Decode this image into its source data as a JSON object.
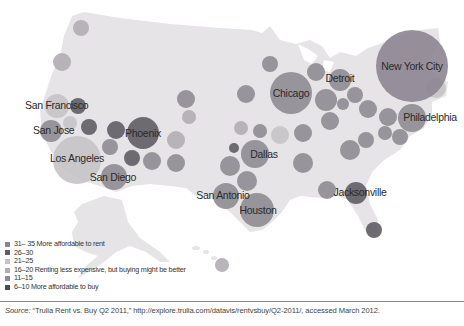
{
  "chart_data": {
    "type": "bubble-map",
    "title": "",
    "legend": [
      {
        "range": "31–35",
        "label": "More affordable to rent",
        "color": "#8d8592"
      },
      {
        "range": "26–30",
        "label": "",
        "color": "#615c64"
      },
      {
        "range": "21–25",
        "label": "",
        "color": "#c6c3c8"
      },
      {
        "range": "16–20",
        "label": "Renting less expensive, but buying might be better",
        "color": "#b1adb3"
      },
      {
        "range": "11–15",
        "label": "",
        "color": "#8f8b92"
      },
      {
        "range": "6–10",
        "label": "More affordable to buy",
        "color": "#4f4b52"
      }
    ],
    "labeled_cities": [
      {
        "name": "New York City",
        "x": 412,
        "y": 66,
        "r": 36,
        "color": "#8d8592"
      },
      {
        "name": "Chicago",
        "x": 291,
        "y": 93,
        "r": 21,
        "color": "#8f8b92"
      },
      {
        "name": "Detroit",
        "x": 340,
        "y": 80,
        "r": 11,
        "color": "#8f8b92"
      },
      {
        "name": "Philadelphia",
        "x": 412,
        "y": 118,
        "r": 14,
        "color": "#8f8b92"
      },
      {
        "name": "San Francisco",
        "x": 57,
        "y": 106,
        "r": 12,
        "color": "#c6c3c8"
      },
      {
        "name": "San Jose",
        "x": 51,
        "y": 131,
        "r": 11,
        "color": "#8f8b92"
      },
      {
        "name": "Los Angeles",
        "x": 77,
        "y": 160,
        "r": 24,
        "color": "#c6c3c8"
      },
      {
        "name": "San Diego",
        "x": 114,
        "y": 177,
        "r": 13,
        "color": "#8f8b92"
      },
      {
        "name": "Phoenix",
        "x": 143,
        "y": 133,
        "r": 16,
        "color": "#615c64"
      },
      {
        "name": "Dallas",
        "x": 255,
        "y": 154,
        "r": 14,
        "color": "#8f8b92"
      },
      {
        "name": "San Antonio",
        "x": 226,
        "y": 196,
        "r": 13,
        "color": "#8f8b92"
      },
      {
        "name": "Houston",
        "x": 257,
        "y": 210,
        "r": 17,
        "color": "#8f8b92"
      },
      {
        "name": "Jacksonville",
        "x": 356,
        "y": 193,
        "r": 11,
        "color": "#615c64"
      }
    ],
    "unlabeled_cities": [
      {
        "x": 81,
        "y": 28,
        "r": 8,
        "color": "#b1adb3"
      },
      {
        "x": 62,
        "y": 62,
        "r": 9,
        "color": "#b1adb3"
      },
      {
        "x": 78,
        "y": 106,
        "r": 8,
        "color": "#615c64"
      },
      {
        "x": 70,
        "y": 123,
        "r": 7,
        "color": "#c6c3c8"
      },
      {
        "x": 89,
        "y": 127,
        "r": 8,
        "color": "#615c64"
      },
      {
        "x": 116,
        "y": 130,
        "r": 9,
        "color": "#615c64"
      },
      {
        "x": 110,
        "y": 147,
        "r": 8,
        "color": "#8f8b92"
      },
      {
        "x": 132,
        "y": 158,
        "r": 8,
        "color": "#615c64"
      },
      {
        "x": 152,
        "y": 161,
        "r": 9,
        "color": "#8f8b92"
      },
      {
        "x": 176,
        "y": 163,
        "r": 9,
        "color": "#8f8b92"
      },
      {
        "x": 186,
        "y": 99,
        "r": 9,
        "color": "#8f8b92"
      },
      {
        "x": 189,
        "y": 117,
        "r": 7,
        "color": "#b1adb3"
      },
      {
        "x": 176,
        "y": 140,
        "r": 9,
        "color": "#b1adb3"
      },
      {
        "x": 246,
        "y": 94,
        "r": 9,
        "color": "#8f8b92"
      },
      {
        "x": 241,
        "y": 128,
        "r": 7,
        "color": "#b1adb3"
      },
      {
        "x": 234,
        "y": 148,
        "r": 5,
        "color": "#615c64"
      },
      {
        "x": 260,
        "y": 131,
        "r": 7,
        "color": "#8f8b92"
      },
      {
        "x": 230,
        "y": 166,
        "r": 10,
        "color": "#8f8b92"
      },
      {
        "x": 247,
        "y": 181,
        "r": 10,
        "color": "#8f8b92"
      },
      {
        "x": 270,
        "y": 64,
        "r": 8,
        "color": "#8f8b92"
      },
      {
        "x": 316,
        "y": 72,
        "r": 9,
        "color": "#8f8b92"
      },
      {
        "x": 326,
        "y": 100,
        "r": 11,
        "color": "#8f8b92"
      },
      {
        "x": 343,
        "y": 104,
        "r": 6,
        "color": "#8f8b92"
      },
      {
        "x": 355,
        "y": 95,
        "r": 8,
        "color": "#8f8b92"
      },
      {
        "x": 368,
        "y": 109,
        "r": 9,
        "color": "#8f8b92"
      },
      {
        "x": 388,
        "y": 117,
        "r": 9,
        "color": "#8f8b92"
      },
      {
        "x": 303,
        "y": 133,
        "r": 9,
        "color": "#8f8b92"
      },
      {
        "x": 330,
        "y": 121,
        "r": 9,
        "color": "#8f8b92"
      },
      {
        "x": 350,
        "y": 150,
        "r": 10,
        "color": "#8f8b92"
      },
      {
        "x": 366,
        "y": 140,
        "r": 8,
        "color": "#8f8b92"
      },
      {
        "x": 385,
        "y": 133,
        "r": 7,
        "color": "#8f8b92"
      },
      {
        "x": 400,
        "y": 137,
        "r": 8,
        "color": "#8f8b92"
      },
      {
        "x": 327,
        "y": 190,
        "r": 9,
        "color": "#8f8b92"
      },
      {
        "x": 280,
        "y": 135,
        "r": 9,
        "color": "#c6c3c8"
      },
      {
        "x": 303,
        "y": 163,
        "r": 10,
        "color": "#8f8b92"
      },
      {
        "x": 436,
        "y": 88,
        "r": 10,
        "color": "#c6c3c8"
      },
      {
        "x": 374,
        "y": 230,
        "r": 8,
        "color": "#615c64"
      },
      {
        "x": 222,
        "y": 265,
        "r": 7,
        "color": "#b1adb3"
      }
    ],
    "annotations": [
      "Source line below map"
    ]
  },
  "legend": {
    "items": [
      "31– 35 More affordable to rent",
      "26–30",
      "21–25",
      "16–20 Renting less expensive, but buying might be better",
      "11–15",
      "6–10 More affordable to buy"
    ]
  },
  "source": {
    "prefix": "Source:",
    "text": " “Trulia Rent vs. Buy Q2 2011,” http://explore.trulia.com/datavis/rentvsbuy/Q2-2011/, accessed March 2012."
  },
  "colors": {
    "land": "#e6e4e6",
    "label": "#2a2a2a"
  }
}
